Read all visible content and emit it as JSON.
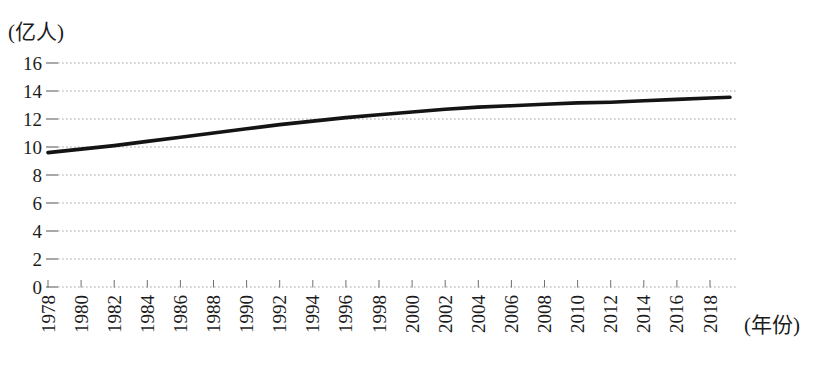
{
  "chart_data": {
    "type": "line",
    "title": "",
    "ylabel": "(亿人)",
    "xlabel": "(年份)",
    "categories": [
      "1978",
      "1980",
      "1982",
      "1984",
      "1986",
      "1988",
      "1990",
      "1992",
      "1994",
      "1996",
      "1998",
      "2000",
      "2002",
      "2004",
      "2006",
      "2008",
      "2010",
      "2012",
      "2014",
      "2016",
      "2018"
    ],
    "values": [
      9.6,
      9.85,
      10.1,
      10.4,
      10.7,
      11.0,
      11.3,
      11.6,
      11.85,
      12.1,
      12.3,
      12.5,
      12.7,
      12.85,
      12.95,
      13.05,
      13.15,
      13.2,
      13.3,
      13.4,
      13.5
    ],
    "line_end_value": 13.55,
    "ylim": [
      0,
      16
    ],
    "yticks": [
      0,
      2,
      4,
      6,
      8,
      10,
      12,
      14,
      16
    ],
    "grid": "horizontal-dotted",
    "legend_position": "none",
    "colors": {
      "line": "#141414",
      "grid": "#a2a2a2",
      "tick": "#6f6f6f",
      "text": "#1c1c1c",
      "background": "#ffffff"
    }
  }
}
